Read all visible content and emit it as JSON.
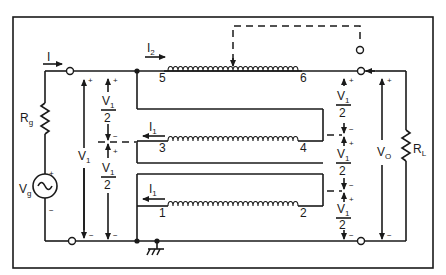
{
  "diagram": {
    "type": "circuit-schematic",
    "source": {
      "generator_label": "V",
      "generator_sub": "g",
      "resistor_label": "R",
      "resistor_sub": "g",
      "input_current": "I",
      "input_voltage": "V",
      "input_voltage_sub": "1"
    },
    "load": {
      "resistor_label": "R",
      "resistor_sub": "L",
      "output_voltage": "V",
      "output_voltage_sub": "O"
    },
    "windings": {
      "top_current": "I",
      "top_current_sub": "2",
      "mid_current": "I",
      "mid_current_sub": "1",
      "bot_current": "I",
      "bot_current_sub": "1",
      "terminals": [
        "1",
        "2",
        "3",
        "4",
        "5",
        "6"
      ]
    },
    "half_voltage": {
      "num": "V",
      "num_sub": "1",
      "den": "2"
    },
    "polarity": {
      "plus": "+",
      "minus": "−"
    }
  }
}
